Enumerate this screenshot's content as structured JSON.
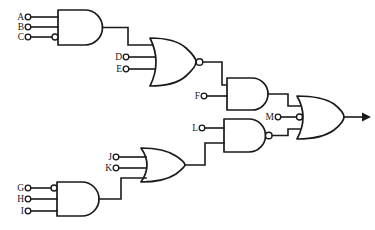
{
  "diagram": {
    "type": "logic-gate-schematic",
    "line_color": "#1a1a1a",
    "background_color": "#ffffff",
    "width": 375,
    "height": 230
  },
  "inputs": [
    {
      "id": "A",
      "label": "A",
      "x": 22,
      "y": 17,
      "inverted": false,
      "gate": "and-1"
    },
    {
      "id": "B",
      "label": "B",
      "x": 22,
      "y": 27,
      "inverted": false,
      "gate": "and-1"
    },
    {
      "id": "C",
      "label": "C",
      "x": 22,
      "y": 37,
      "inverted": true,
      "gate": "and-1"
    },
    {
      "id": "D",
      "label": "D",
      "x": 120,
      "y": 57,
      "inverted": false,
      "gate": "nor-1"
    },
    {
      "id": "E",
      "label": "E",
      "x": 120,
      "y": 69,
      "inverted": false,
      "gate": "nor-1"
    },
    {
      "id": "F",
      "label": "F",
      "x": 198,
      "y": 96,
      "inverted": false,
      "gate": "and-2"
    },
    {
      "id": "G",
      "label": "G",
      "x": 22,
      "y": 188,
      "inverted": true,
      "gate": "and-3"
    },
    {
      "id": "H",
      "label": "H",
      "x": 22,
      "y": 199,
      "inverted": false,
      "gate": "and-3"
    },
    {
      "id": "I",
      "label": "I",
      "x": 22,
      "y": 211,
      "inverted": false,
      "gate": "and-3"
    },
    {
      "id": "J",
      "label": "J",
      "x": 110,
      "y": 157,
      "inverted": false,
      "gate": "or-1"
    },
    {
      "id": "K",
      "label": "K",
      "x": 110,
      "y": 168,
      "inverted": false,
      "gate": "or-1"
    },
    {
      "id": "L",
      "label": "L",
      "x": 196,
      "y": 128,
      "inverted": false,
      "gate": "nand-1"
    },
    {
      "id": "M",
      "label": "M",
      "x": 272,
      "y": 117,
      "inverted": true,
      "gate": "or-2"
    }
  ],
  "gates": [
    {
      "id": "and-1",
      "kind": "AND",
      "label": "AND",
      "num_inputs": 3,
      "inverted_output": false,
      "inverted_inputs": [
        "C"
      ]
    },
    {
      "id": "nor-1",
      "kind": "NOR",
      "label": "NOR",
      "num_inputs": 3,
      "inverted_output": true,
      "inverted_inputs": []
    },
    {
      "id": "and-2",
      "kind": "AND",
      "label": "AND",
      "num_inputs": 2,
      "inverted_output": false,
      "inverted_inputs": []
    },
    {
      "id": "and-3",
      "kind": "AND",
      "label": "AND",
      "num_inputs": 3,
      "inverted_output": false,
      "inverted_inputs": [
        "G"
      ]
    },
    {
      "id": "or-1",
      "kind": "OR",
      "label": "OR",
      "num_inputs": 3,
      "inverted_output": false,
      "inverted_inputs": []
    },
    {
      "id": "nand-1",
      "kind": "NAND",
      "label": "NAND",
      "num_inputs": 2,
      "inverted_output": true,
      "inverted_inputs": []
    },
    {
      "id": "or-2",
      "kind": "OR",
      "label": "OR",
      "num_inputs": 3,
      "inverted_output": false,
      "inverted_inputs": [
        "M"
      ]
    }
  ],
  "connections": [
    {
      "from": "and-1",
      "to": "nor-1"
    },
    {
      "from": "nor-1",
      "to": "and-2"
    },
    {
      "from": "and-2",
      "to": "or-2"
    },
    {
      "from": "and-3",
      "to": "or-1"
    },
    {
      "from": "or-1",
      "to": "nand-1"
    },
    {
      "from": "nand-1",
      "to": "or-2"
    }
  ],
  "output": {
    "id": "out",
    "label": "",
    "has_arrow": true,
    "x": 365,
    "y": 117
  }
}
